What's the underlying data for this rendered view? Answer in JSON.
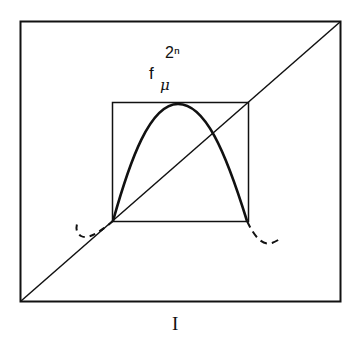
{
  "diagram": {
    "function_label": {
      "base": "f",
      "subscript": "μ",
      "superscript": "2ⁿ"
    },
    "interval_label": "I",
    "elements": {
      "outer_box": "unit interval square",
      "inner_box": "renormalization sub-box",
      "diagonal": "identity line y=x",
      "curve": "unimodal map f_mu^(2^n) restricted to inner box",
      "dashed_tails": "continuation of curve outside inner box"
    },
    "colors": {
      "stroke": "#111111",
      "background": "#ffffff"
    }
  }
}
